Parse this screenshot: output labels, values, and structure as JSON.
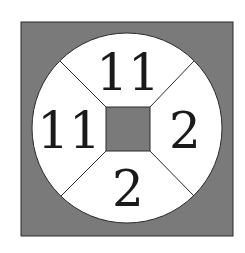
{
  "diagram": {
    "type": "number-wheel-puzzle",
    "colors": {
      "background": "#ffffff",
      "outer_square_fill": "#7a7a7a",
      "circle_fill": "#ffffff",
      "center_square_fill": "#7a7a7a",
      "stroke": "#2a2a2a",
      "text": "#1a1a1a"
    },
    "segments": {
      "top": "11",
      "left": "11",
      "right": "2",
      "bottom": "2"
    }
  }
}
